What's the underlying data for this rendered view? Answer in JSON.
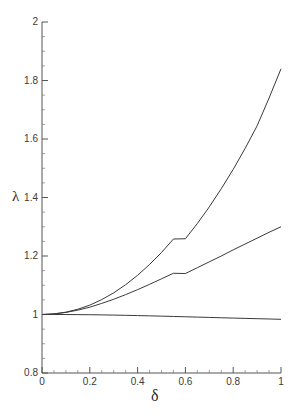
{
  "chart_data": {
    "type": "line",
    "title": "",
    "xlabel": "δ",
    "ylabel": "λ",
    "xlim": [
      0,
      1
    ],
    "ylim": [
      0.8,
      2
    ],
    "grid": false,
    "legend": "none",
    "xticks": [
      "0",
      "0.2",
      "0.4",
      "0.6",
      "0.8",
      "1"
    ],
    "xtick_values": [
      0,
      0.2,
      0.4,
      0.6,
      0.8,
      1
    ],
    "yticks": [
      "0.8",
      "1",
      "1.2",
      "1.4",
      "1.6",
      "1.8",
      "2"
    ],
    "ytick_values": [
      0.8,
      1,
      1.2,
      1.4,
      1.6,
      1.8,
      2
    ],
    "x": [
      0,
      0.05,
      0.1,
      0.15,
      0.2,
      0.25,
      0.3,
      0.35,
      0.4,
      0.45,
      0.5,
      0.55,
      0.6,
      0.65,
      0.7,
      0.75,
      0.8,
      0.85,
      0.9,
      0.95,
      1
    ],
    "series": [
      {
        "name": "upper-curve",
        "color": "#3a3a3a",
        "values": [
          1.0,
          1.002,
          1.008,
          1.018,
          1.032,
          1.051,
          1.074,
          1.102,
          1.134,
          1.171,
          1.212,
          1.258,
          1.259,
          1.311,
          1.368,
          1.43,
          1.496,
          1.568,
          1.645,
          1.74,
          1.84
        ]
      },
      {
        "name": "middle-curve",
        "color": "#3a3a3a",
        "values": [
          1.0,
          1.002,
          1.007,
          1.015,
          1.025,
          1.038,
          1.052,
          1.068,
          1.085,
          1.103,
          1.122,
          1.141,
          1.14,
          1.16,
          1.18,
          1.2,
          1.221,
          1.241,
          1.261,
          1.281,
          1.3
        ]
      },
      {
        "name": "lower-curve",
        "color": "#3a3a3a",
        "values": [
          1.0,
          1.0,
          0.9999,
          0.9996,
          0.9992,
          0.9987,
          0.998,
          0.9972,
          0.9963,
          0.9954,
          0.9944,
          0.9933,
          0.9922,
          0.9911,
          0.99,
          0.9889,
          0.9878,
          0.9867,
          0.9857,
          0.9847,
          0.9835
        ]
      }
    ],
    "annotations": []
  },
  "axes": {
    "x_title": "δ",
    "y_title": "λ",
    "xtick_labels": [
      "0",
      "0.2",
      "0.4",
      "0.6",
      "0.8",
      "1"
    ],
    "ytick_labels": [
      "2",
      "1.8",
      "1.6",
      "1.4",
      "1.2",
      "1",
      "0.8"
    ],
    "axis_color": "#555555",
    "curve_color": "#3a3a3a"
  }
}
